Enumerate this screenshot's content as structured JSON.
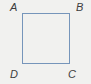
{
  "figure": {
    "type": "square-diagram",
    "background_color": "#f1f1ef",
    "square": {
      "border_color": "#7695ba"
    },
    "vertex_labels": {
      "top_left": "A",
      "top_right": "B",
      "bottom_right": "C",
      "bottom_left": "D"
    }
  }
}
